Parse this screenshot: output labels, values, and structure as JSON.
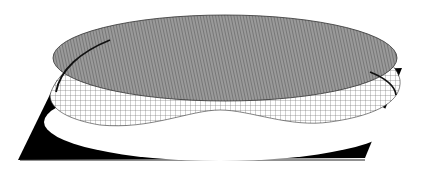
{
  "figure": {
    "colors": {
      "background": "#ffffff",
      "base": "#000000",
      "top_surface": "#8a8a8a",
      "mesh_lines": "#555555",
      "skirt": "#ffffff"
    }
  }
}
